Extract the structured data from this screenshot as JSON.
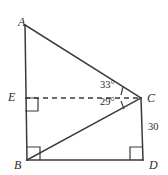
{
  "figure": {
    "background_color": "#ffffff",
    "stroke_color": "#3a3a3a",
    "label_color": "#2b2b2b",
    "vertices": [
      {
        "name": "A",
        "label": "A",
        "x": 25,
        "y": 25
      },
      {
        "name": "E",
        "label": "E",
        "x": 25,
        "y": 98
      },
      {
        "name": "B",
        "label": "B",
        "x": 27,
        "y": 160
      },
      {
        "name": "C",
        "label": "C",
        "x": 141,
        "y": 98
      },
      {
        "name": "D",
        "label": "D",
        "x": 143,
        "y": 160
      }
    ],
    "segments": [
      {
        "name": "segment-AB",
        "from": "A",
        "to": "B",
        "style": "solid"
      },
      {
        "name": "segment-AC",
        "from": "A",
        "to": "C",
        "style": "solid"
      },
      {
        "name": "segment-BC",
        "from": "B",
        "to": "C",
        "style": "solid"
      },
      {
        "name": "segment-BD",
        "from": "B",
        "to": "D",
        "style": "solid"
      },
      {
        "name": "segment-CD",
        "from": "C",
        "to": "D",
        "style": "solid"
      },
      {
        "name": "segment-EC",
        "from": "E",
        "to": "C",
        "style": "dashed"
      }
    ],
    "right_angles": [
      {
        "name": "right-angle-E",
        "at": "E"
      },
      {
        "name": "right-angle-B",
        "at": "B"
      },
      {
        "name": "right-angle-D",
        "at": "D"
      }
    ],
    "angles": [
      {
        "name": "angle-ACE",
        "label": "33°",
        "value": 33,
        "unit": "degrees",
        "vertex": "C",
        "between": [
          "A",
          "E"
        ]
      },
      {
        "name": "angle-ECB",
        "label": "29°",
        "value": 29,
        "unit": "degrees",
        "vertex": "C",
        "between": [
          "E",
          "B"
        ]
      }
    ],
    "side_labels": [
      {
        "name": "side-CD-length",
        "label": "30",
        "value": 30,
        "segment": "segment-CD"
      }
    ]
  }
}
